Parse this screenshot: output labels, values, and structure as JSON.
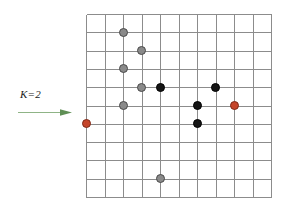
{
  "figure": {
    "width": 290,
    "height": 209,
    "background": "#ffffff"
  },
  "annotation": {
    "label": "K=2",
    "arrow_name": "rightward-arrow",
    "arrow_color": "#6d9e62",
    "arrow_direction": "right",
    "arrow_x1": 2,
    "arrow_y1": 5,
    "arrow_x2": 54,
    "arrow_y2": 5
  },
  "grid": {
    "columns": 10,
    "rows": 10,
    "cell_width": 18.5,
    "cell_height": 18.3,
    "line_color": "#8c8c8c",
    "border_color": "#6e6e6e",
    "line_width": 1,
    "origin_x": 86,
    "origin_y": 14
  },
  "legend_colors": {
    "gray_node": "#8a8a8a",
    "black_node": "#151515",
    "red_node": "#c5452a"
  },
  "chart_data": {
    "type": "scatter",
    "xlabel": "",
    "ylabel": "",
    "xlim": [
      0,
      10
    ],
    "ylim": [
      0,
      10
    ],
    "grid": true,
    "legend": "none",
    "annotations": [
      {
        "text": "K=2",
        "x": -4.0,
        "y": 4.6,
        "style": "italic"
      }
    ],
    "series": [
      {
        "name": "gray-nodes",
        "color": "#8a8a8a",
        "points": [
          {
            "col": 2,
            "row": 1
          },
          {
            "col": 3,
            "row": 2
          },
          {
            "col": 2,
            "row": 3
          },
          {
            "col": 3,
            "row": 4
          },
          {
            "col": 2,
            "row": 5
          },
          {
            "col": 4,
            "row": 9
          }
        ]
      },
      {
        "name": "black-nodes",
        "color": "#151515",
        "points": [
          {
            "col": 4,
            "row": 4
          },
          {
            "col": 7,
            "row": 4
          },
          {
            "col": 6,
            "row": 5
          },
          {
            "col": 6,
            "row": 6
          }
        ]
      },
      {
        "name": "red-nodes",
        "color": "#c5452a",
        "points": [
          {
            "col": 0,
            "row": 6
          },
          {
            "col": 8,
            "row": 5
          }
        ]
      }
    ]
  }
}
